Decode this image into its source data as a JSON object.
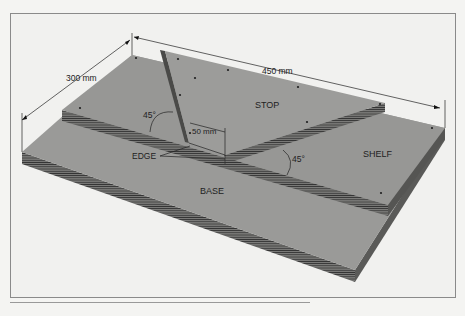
{
  "diagram": {
    "labels": {
      "width_dim": "300 mm",
      "length_dim": "450 mm",
      "stop_offset_dim": "50 mm",
      "angle_left": "45°",
      "angle_right": "45°",
      "stop": "STOP",
      "shelf": "SHELF",
      "base": "BASE",
      "edge": "EDGE"
    },
    "colors": {
      "board_top": "#9a9a98",
      "board_edge": "#6e6e6c",
      "ply_line": "#2a2a2a",
      "background": "#f1f1ef",
      "frame": "#8a8a8a"
    }
  }
}
